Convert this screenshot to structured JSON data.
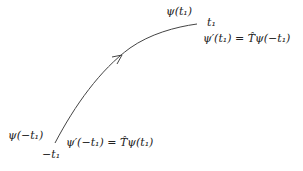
{
  "diagram": {
    "curve": {
      "direction": "from -t1 to t1",
      "stroke_color": "#444444"
    },
    "labels": {
      "psi_t1": "ψ(t₁)",
      "t1": "t₁",
      "psi_prime_t1": "ψ′(t₁) = T̂ψ(−t₁)",
      "psi_minus_t1": "ψ(−t₁)",
      "minus_t1": "−t₁",
      "psi_prime_minus_t1": "ψ′(−t₁) = T̂ψ(t₁)"
    }
  }
}
